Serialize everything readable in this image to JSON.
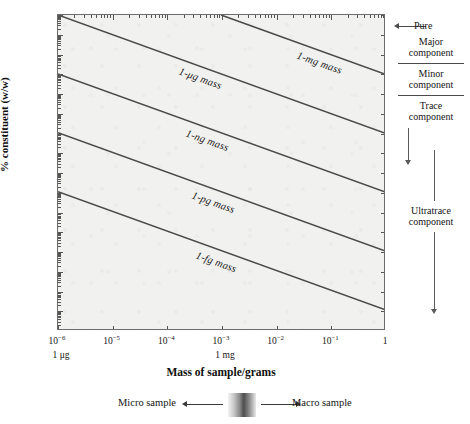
{
  "chart_data": {
    "type": "line",
    "title": "",
    "xlabel": "Mass of sample/grams",
    "ylabel": "% constituent (w/w)",
    "xscale": "log",
    "yscale": "log",
    "xlim": [
      1e-06,
      1
    ],
    "ylim": [
      1e-14,
      100
    ],
    "grid": false,
    "legend": "inline-line-labels",
    "x_ticks": [
      {
        "value": 1e-06,
        "label": "10−6",
        "sub": "1 μg"
      },
      {
        "value": 1e-05,
        "label": "10−5",
        "sub": ""
      },
      {
        "value": 0.0001,
        "label": "10−4",
        "sub": ""
      },
      {
        "value": 0.001,
        "label": "10−3",
        "sub": "1 mg"
      },
      {
        "value": 0.01,
        "label": "10−2",
        "sub": ""
      },
      {
        "value": 0.1,
        "label": "10−1",
        "sub": ""
      },
      {
        "value": 1,
        "label": "1",
        "sub": ""
      }
    ],
    "y_ticks": [
      {
        "value": 100,
        "label": "10²"
      },
      {
        "value": 10,
        "label": "10¹"
      },
      {
        "value": 1,
        "label": "1"
      },
      {
        "value": 0.1,
        "label": "10−1"
      },
      {
        "value": 0.01,
        "label": "10−2"
      },
      {
        "value": 0.001,
        "label": "10−3"
      },
      {
        "value": 0.0001,
        "label": "10−4"
      },
      {
        "value": 1e-05,
        "label": "10−5"
      },
      {
        "value": 1e-06,
        "label": "10−6"
      },
      {
        "value": 1e-07,
        "label": "10−7"
      },
      {
        "value": 1e-08,
        "label": "10−8"
      },
      {
        "value": 1e-09,
        "label": "10−9"
      },
      {
        "value": 1e-10,
        "label": "10−10"
      },
      {
        "value": 1e-11,
        "label": "10−11"
      },
      {
        "value": 1e-12,
        "label": "10−12"
      },
      {
        "value": 1e-13,
        "label": "10−13"
      },
      {
        "value": 1e-14,
        "label": "10−14"
      }
    ],
    "series": [
      {
        "name": "1-mg mass",
        "label": "1-mg mass",
        "constituent_mass_grams": 0.001,
        "points": [
          {
            "x": 0.001,
            "y": 100
          },
          {
            "x": 1,
            "y": 0.1
          }
        ]
      },
      {
        "name": "1-μg mass",
        "label": "1-μg mass",
        "constituent_mass_grams": 1e-06,
        "points": [
          {
            "x": 1e-06,
            "y": 100
          },
          {
            "x": 1,
            "y": 0.0001
          }
        ]
      },
      {
        "name": "1-ng mass",
        "label": "1-ng mass",
        "constituent_mass_grams": 1e-09,
        "points": [
          {
            "x": 1e-06,
            "y": 0.1
          },
          {
            "x": 1,
            "y": 1e-07
          }
        ]
      },
      {
        "name": "1-pg mass",
        "label": "1-pg mass",
        "constituent_mass_grams": 1e-12,
        "points": [
          {
            "x": 1e-06,
            "y": 0.0001
          },
          {
            "x": 1,
            "y": 1e-10
          }
        ]
      },
      {
        "name": "1-fg mass",
        "label": "1-fg mass",
        "constituent_mass_grams": 1e-15,
        "points": [
          {
            "x": 1e-06,
            "y": 1e-07
          },
          {
            "x": 1,
            "y": 1e-13
          }
        ]
      }
    ],
    "line_color": "#4a4a4a",
    "plot_background": "#f1f1ef",
    "frame_color": "#6b6b6b"
  },
  "right_legend": {
    "pure_label": "Pure",
    "bands": [
      {
        "name": "major",
        "line1": "Major",
        "line2": "component"
      },
      {
        "name": "minor",
        "line1": "Minor",
        "line2": "component"
      },
      {
        "name": "trace",
        "line1": "Trace",
        "line2": "component"
      },
      {
        "name": "ultratrace",
        "line1": "Ultratrace",
        "line2": "component"
      }
    ]
  },
  "sample_scale": {
    "micro_label": "Micro sample",
    "macro_label": "Macro sample"
  }
}
